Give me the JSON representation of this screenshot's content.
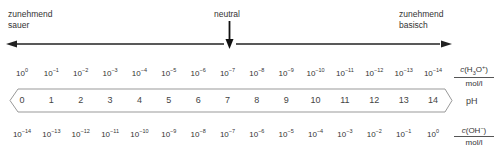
{
  "labels": {
    "left": [
      "zunehmend",
      "sauer"
    ],
    "center": "neutral",
    "right": [
      "zunehmend",
      "basisch"
    ]
  },
  "h3o_row": {
    "values": [
      "10^0",
      "10^-1",
      "10^-2",
      "10^-3",
      "10^-4",
      "10^-5",
      "10^-6",
      "10^-7",
      "10^-8",
      "10^-9",
      "10^-10",
      "10^-11",
      "10^-12",
      "10^-13",
      "10^-14"
    ],
    "unit_numerator": "c(H3O+)",
    "unit_denominator": "mol/l"
  },
  "ph_row": {
    "values": [
      "0",
      "1",
      "2",
      "3",
      "4",
      "5",
      "6",
      "7",
      "8",
      "9",
      "10",
      "11",
      "12",
      "13",
      "14"
    ],
    "label": "pH"
  },
  "oh_row": {
    "values": [
      "10^-14",
      "10^-13",
      "10^-12",
      "10^-11",
      "10^-10",
      "10^-9",
      "10^-8",
      "10^-7",
      "10^-6",
      "10^-5",
      "10^-4",
      "10^-3",
      "10^-2",
      "10^-1",
      "10^0"
    ],
    "unit_numerator": "c(OH-)",
    "unit_denominator": "mol/l"
  },
  "colors": {
    "line": "#222222",
    "text": "#333333",
    "ph_scale_border": "#999999"
  }
}
